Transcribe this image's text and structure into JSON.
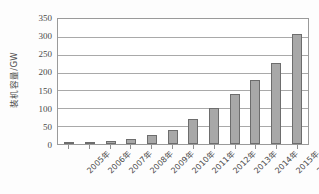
{
  "chart_data": {
    "type": "bar",
    "title": "",
    "subtitle": "",
    "xlabel": "",
    "ylabel": "装机容量/GW",
    "categories": [
      "2005年",
      "2006年",
      "2007年",
      "2008年",
      "2009年",
      "2010年",
      "2011年",
      "2012年",
      "2013年",
      "2014年",
      "2015年",
      "2016年"
    ],
    "values": [
      5,
      6,
      9,
      15,
      24,
      40,
      70,
      100,
      139,
      180,
      228,
      307
    ],
    "series": [
      {
        "name": "装机容量",
        "values": [
          5,
          6,
          9,
          15,
          24,
          40,
          70,
          100,
          139,
          180,
          228,
          307
        ]
      }
    ],
    "ylim": [
      0,
      350
    ],
    "ytick_labels": [
      "0",
      "50",
      "100",
      "150",
      "200",
      "250",
      "300",
      "350"
    ],
    "ytick_values": [
      0,
      50,
      100,
      150,
      200,
      250,
      300,
      350
    ],
    "grid": true,
    "grid_orientation": "horizontal",
    "legend": false,
    "legend_position": "none",
    "annotations": [],
    "colors": {
      "bar_fill": "#a8a8a8",
      "bar_border": "#6d6d6d",
      "gridline": "#a9a9a9",
      "axis_border": "#9a9a9a",
      "text": "#4a4a4a",
      "background": "#ffffff"
    }
  }
}
